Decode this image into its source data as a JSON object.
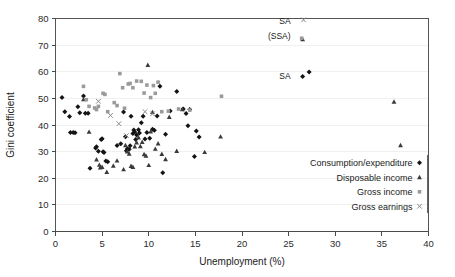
{
  "chart_data": {
    "type": "scatter",
    "title": "",
    "xlabel": "Unemployment (%)",
    "ylabel": "Gini coefficient",
    "xlim": [
      0,
      40
    ],
    "ylim": [
      0,
      80
    ],
    "xticks": [
      0,
      5,
      10,
      15,
      20,
      25,
      30,
      35,
      40
    ],
    "yticks": [
      0,
      10,
      20,
      30,
      40,
      50,
      60,
      70,
      80
    ],
    "grid": "horizontal-faint",
    "legend_position": "bottom-right-inside",
    "series": [
      {
        "name": "Consumption/expenditure",
        "marker": "diamond",
        "color": "#141414",
        "points": [
          [
            0.7,
            50.3
          ],
          [
            1.0,
            45.0
          ],
          [
            1.5,
            43.2
          ],
          [
            1.6,
            37.2
          ],
          [
            1.9,
            37.2
          ],
          [
            2.1,
            37.1
          ],
          [
            2.4,
            46.9
          ],
          [
            2.6,
            44.6
          ],
          [
            3.0,
            50.9
          ],
          [
            3.2,
            44.4
          ],
          [
            3.5,
            44.4
          ],
          [
            3.7,
            23.8
          ],
          [
            4.3,
            31.4
          ],
          [
            4.4,
            31.8
          ],
          [
            4.6,
            30.1
          ],
          [
            4.9,
            34.6
          ],
          [
            5.0,
            34.8
          ],
          [
            5.1,
            30.0
          ],
          [
            5.2,
            29.7
          ],
          [
            5.4,
            26.5
          ],
          [
            5.6,
            26.2
          ],
          [
            6.6,
            32.3
          ],
          [
            7.0,
            33.0
          ],
          [
            7.3,
            44.9
          ],
          [
            7.5,
            35.6
          ],
          [
            7.6,
            30.3
          ],
          [
            7.7,
            31.1
          ],
          [
            7.9,
            30.9
          ],
          [
            8.0,
            32.2
          ],
          [
            8.1,
            43.3
          ],
          [
            8.3,
            36.8
          ],
          [
            8.4,
            38.1
          ],
          [
            8.5,
            37.4
          ],
          [
            8.6,
            34.6
          ],
          [
            8.7,
            36.2
          ],
          [
            8.9,
            38.2
          ],
          [
            9.0,
            37.0
          ],
          [
            9.2,
            40.8
          ],
          [
            9.4,
            43.3
          ],
          [
            9.6,
            34.7
          ],
          [
            9.8,
            37.2
          ],
          [
            10.1,
            35.0
          ],
          [
            10.4,
            38.4
          ],
          [
            10.6,
            38.0
          ],
          [
            10.9,
            43.4
          ],
          [
            11.2,
            54.6
          ],
          [
            11.5,
            22.1
          ],
          [
            11.8,
            36.5
          ],
          [
            12.3,
            45.3
          ],
          [
            13.0,
            52.6
          ],
          [
            13.7,
            46.0
          ],
          [
            14.0,
            44.3
          ],
          [
            14.2,
            39.7
          ],
          [
            14.4,
            45.8
          ],
          [
            14.9,
            28.2
          ],
          [
            15.1,
            37.7
          ],
          [
            15.4,
            35.5
          ],
          [
            26.5,
            58.2
          ],
          [
            27.2,
            59.9
          ]
        ]
      },
      {
        "name": "Disposable income",
        "marker": "triangle",
        "color": "#3a3a3a",
        "points": [
          [
            3.0,
            49.6
          ],
          [
            3.6,
            37.4
          ],
          [
            4.4,
            27.0
          ],
          [
            4.7,
            25.0
          ],
          [
            4.8,
            24.0
          ],
          [
            5.0,
            24.2
          ],
          [
            5.5,
            22.3
          ],
          [
            6.2,
            24.7
          ],
          [
            6.6,
            26.6
          ],
          [
            7.3,
            23.3
          ],
          [
            7.5,
            32.4
          ],
          [
            7.7,
            30.0
          ],
          [
            7.9,
            29.2
          ],
          [
            8.1,
            24.6
          ],
          [
            8.3,
            24.2
          ],
          [
            8.5,
            31.9
          ],
          [
            8.7,
            33.4
          ],
          [
            8.9,
            35.3
          ],
          [
            9.1,
            32.0
          ],
          [
            9.3,
            33.6
          ],
          [
            9.5,
            29.0
          ],
          [
            9.7,
            28.4
          ],
          [
            9.9,
            62.5
          ],
          [
            10.0,
            24.9
          ],
          [
            10.2,
            37.5
          ],
          [
            10.4,
            44.8
          ],
          [
            10.7,
            31.0
          ],
          [
            11.0,
            33.0
          ],
          [
            11.4,
            29.1
          ],
          [
            11.8,
            27.1
          ],
          [
            12.2,
            43.0
          ],
          [
            13.0,
            30.2
          ],
          [
            13.6,
            45.9
          ],
          [
            16.0,
            29.8
          ],
          [
            17.7,
            35.6
          ],
          [
            26.5,
            72.2
          ],
          [
            36.3,
            48.7
          ],
          [
            37.0,
            32.4
          ]
        ]
      },
      {
        "name": "Gross income",
        "marker": "square",
        "color": "#9a9a9a",
        "points": [
          [
            3.0,
            54.5
          ],
          [
            3.3,
            49.5
          ],
          [
            3.6,
            47.0
          ],
          [
            4.2,
            46.4
          ],
          [
            4.4,
            45.8
          ],
          [
            4.6,
            47.0
          ],
          [
            5.1,
            51.9
          ],
          [
            5.3,
            51.5
          ],
          [
            5.6,
            45.0
          ],
          [
            6.3,
            48.4
          ],
          [
            6.6,
            47.3
          ],
          [
            6.9,
            59.3
          ],
          [
            7.2,
            54.0
          ],
          [
            7.4,
            46.3
          ],
          [
            7.8,
            55.4
          ],
          [
            8.0,
            55.6
          ],
          [
            8.3,
            54.0
          ],
          [
            8.7,
            56.5
          ],
          [
            9.2,
            56.4
          ],
          [
            9.5,
            52.0
          ],
          [
            9.8,
            55.0
          ],
          [
            10.2,
            50.3
          ],
          [
            10.5,
            54.8
          ],
          [
            10.7,
            51.9
          ],
          [
            11.0,
            56.1
          ],
          [
            11.4,
            45.0
          ],
          [
            12.1,
            45.2
          ],
          [
            13.2,
            46.0
          ],
          [
            14.4,
            45.6
          ],
          [
            17.8,
            50.8
          ],
          [
            26.4,
            72.6
          ]
        ]
      },
      {
        "name": "Gross earnings",
        "marker": "cross",
        "color": "#8a8a8a",
        "points": [
          [
            4.6,
            48.9
          ],
          [
            6.8,
            40.5
          ],
          [
            5.9,
            43.6
          ],
          [
            7.6,
            36.0
          ],
          [
            9.6,
            45.0
          ],
          [
            10.4,
            44.2
          ],
          [
            26.6,
            79.5
          ]
        ]
      }
    ],
    "annotations": [
      {
        "text": "SA",
        "x": 24.6,
        "y": 79.0
      },
      {
        "text": "(SSA)",
        "x": 24.0,
        "y": 73.6
      },
      {
        "text": "SA",
        "x": 24.6,
        "y": 58.3
      }
    ]
  },
  "legend": {
    "items": [
      {
        "label": "Consumption/expenditure",
        "marker": "diamond"
      },
      {
        "label": "Disposable income",
        "marker": "triangle"
      },
      {
        "label": "Gross income",
        "marker": "square"
      },
      {
        "label": "Gross earnings",
        "marker": "cross"
      }
    ]
  }
}
